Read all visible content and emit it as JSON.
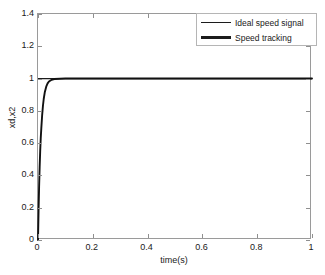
{
  "chart_data": {
    "type": "line",
    "title": "",
    "xlabel": "time(s)",
    "ylabel": "xd,x2",
    "xlim": [
      0,
      1
    ],
    "ylim": [
      0,
      1.4
    ],
    "xticks": [
      0,
      0.2,
      0.4,
      0.6,
      0.8,
      1
    ],
    "xticklabels": [
      "0",
      "0.2",
      "0.4",
      "0.6",
      "0.8",
      "1"
    ],
    "yticks": [
      0,
      0.2,
      0.4,
      0.6,
      0.8,
      1,
      1.2,
      1.4
    ],
    "yticklabels": [
      "0",
      "0.2",
      "0.4",
      "0.6",
      "0.8",
      "1",
      "1.2",
      "1.4"
    ],
    "grid": false,
    "legend_position": "top-right",
    "series": [
      {
        "name": "Ideal speed signal",
        "color": "#1c1c1c",
        "linewidth": 1.2,
        "x": [
          0,
          0.02,
          0.05,
          0.1,
          0.2,
          0.3,
          0.4,
          0.5,
          0.6,
          0.7,
          0.8,
          0.9,
          1
        ],
        "values": [
          1,
          1,
          1,
          1,
          1,
          1,
          1,
          1,
          1,
          1,
          1,
          1,
          1
        ]
      },
      {
        "name": "Speed tracking",
        "color": "#111111",
        "linewidth": 1.8,
        "x": [
          0,
          0.002,
          0.004,
          0.006,
          0.008,
          0.01,
          0.012,
          0.015,
          0.018,
          0.021,
          0.025,
          0.03,
          0.035,
          0.04,
          0.05,
          0.06,
          0.08,
          0.1,
          0.2,
          0.4,
          0.6,
          0.8,
          1
        ],
        "values": [
          0,
          0.18,
          0.33,
          0.45,
          0.55,
          0.63,
          0.69,
          0.77,
          0.83,
          0.875,
          0.917,
          0.95,
          0.97,
          0.982,
          0.993,
          0.997,
          0.999,
          1,
          1,
          1,
          1,
          1,
          1
        ]
      }
    ],
    "annotations": []
  },
  "legend": {
    "entries": [
      {
        "label": "Ideal speed signal",
        "style": "thin"
      },
      {
        "label": "Speed tracking",
        "style": "thick"
      }
    ]
  }
}
